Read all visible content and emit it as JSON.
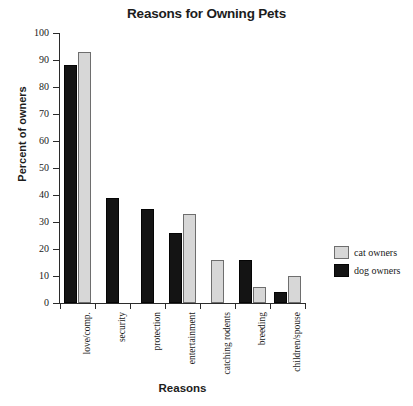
{
  "chart_data": {
    "type": "bar",
    "title": "Reasons for Owning Pets",
    "xlabel": "Reasons",
    "ylabel": "Percent of owners",
    "ylim": [
      0,
      100
    ],
    "yticks": [
      0,
      10,
      20,
      30,
      40,
      50,
      60,
      70,
      80,
      90,
      100
    ],
    "grid": false,
    "legend_position": "right",
    "categories": [
      "love/comp.",
      "security",
      "protection",
      "entertainment",
      "catching rodents",
      "breeding",
      "children/spouse"
    ],
    "series": [
      {
        "name": "dog owners",
        "color": "#141414",
        "values": [
          88,
          39,
          35,
          26,
          0,
          16,
          4
        ]
      },
      {
        "name": "cat owners",
        "color": "#d7d7d7",
        "values": [
          93,
          0,
          0,
          33,
          16,
          6,
          10
        ]
      }
    ]
  },
  "legend": {
    "items": [
      {
        "label": "cat owners",
        "swatch": "cat"
      },
      {
        "label": "dog owners",
        "swatch": "dog"
      }
    ]
  }
}
